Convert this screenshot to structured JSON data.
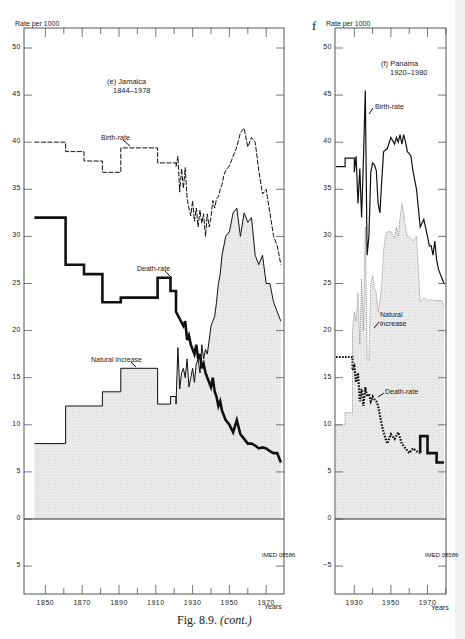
{
  "figure": {
    "caption": "Fig. 8.9. (cont.)",
    "caption_prefix": "Fig. 8.9.",
    "caption_suffix": "(cont.)",
    "panel_f_letter": "f"
  },
  "colors": {
    "fill": "#e3e3e3",
    "line": "#111111",
    "axis": "#555555",
    "text": "#222222"
  },
  "chart_data": [
    {
      "type": "line",
      "title": "(e) Jamaica 1844–1978",
      "title_line1": "(e) Jamaica",
      "title_line2": "1844–1978",
      "ylabel": "Rate per 1000",
      "xlabel": "Years",
      "ylim": [
        -7,
        52
      ],
      "xlim": [
        1840,
        1980
      ],
      "y_ticks": [
        "50",
        "45",
        "40",
        "35",
        "30",
        "25",
        "20",
        "15",
        "10",
        "5",
        "0",
        "5"
      ],
      "x_ticks": [
        "1850",
        "1870",
        "1890",
        "1910",
        "1930",
        "1950",
        "1970"
      ],
      "grid": false,
      "legend": "inline labels",
      "annotations": [
        "Birth-rate",
        "Death-rate",
        "Natural increase"
      ],
      "stamp": "IMED 08586",
      "series": [
        {
          "name": "Birth-rate",
          "style": "dashed",
          "x": [
            1844,
            1861,
            1861,
            1871,
            1871,
            1881,
            1881,
            1891,
            1891,
            1911,
            1911,
            1921,
            1921,
            1922,
            1923,
            1924,
            1925,
            1926,
            1927,
            1928,
            1929,
            1930,
            1931,
            1932,
            1933,
            1934,
            1935,
            1936,
            1937,
            1938,
            1939,
            1940,
            1941,
            1942,
            1943,
            1944,
            1945,
            1946,
            1947,
            1948,
            1950,
            1952,
            1954,
            1956,
            1958,
            1960,
            1962,
            1964,
            1966,
            1968,
            1970,
            1972,
            1974,
            1976,
            1978
          ],
          "values": [
            40.0,
            40.0,
            39.0,
            39.0,
            38.0,
            38.0,
            36.8,
            36.8,
            39.4,
            39.4,
            37.8,
            37.8,
            37.4,
            38.5,
            34.7,
            37.2,
            35.1,
            37.3,
            34.0,
            33.0,
            32.2,
            33.8,
            31.6,
            33.0,
            31.0,
            32.8,
            31.4,
            32.4,
            30.0,
            32.4,
            31.0,
            32.0,
            33.8,
            33.0,
            34.0,
            34.2,
            35.0,
            35.5,
            36.5,
            37.0,
            37.5,
            38.5,
            39.5,
            41.0,
            41.5,
            39.5,
            40.5,
            40.0,
            37.0,
            34.5,
            35.0,
            32.5,
            30.0,
            29.0,
            27.0
          ]
        },
        {
          "name": "Death-rate",
          "style": "thick-solid",
          "x": [
            1844,
            1861,
            1861,
            1871,
            1871,
            1881,
            1881,
            1891,
            1891,
            1911,
            1911,
            1918,
            1918,
            1921,
            1921,
            1925,
            1926,
            1927,
            1928,
            1929,
            1930,
            1931,
            1932,
            1933,
            1934,
            1935,
            1936,
            1937,
            1938,
            1939,
            1940,
            1941,
            1942,
            1943,
            1944,
            1945,
            1946,
            1947,
            1948,
            1950,
            1952,
            1954,
            1956,
            1958,
            1960,
            1962,
            1964,
            1966,
            1968,
            1970,
            1972,
            1974,
            1976,
            1978
          ],
          "values": [
            32.0,
            32.0,
            27.0,
            27.0,
            26.0,
            26.0,
            23.0,
            23.0,
            23.5,
            23.5,
            25.6,
            25.6,
            24.2,
            24.2,
            22.0,
            20.5,
            21.0,
            19.0,
            19.5,
            18.5,
            18.0,
            17.5,
            18.5,
            17.0,
            17.5,
            16.0,
            16.5,
            15.5,
            15.0,
            14.5,
            14.0,
            15.0,
            13.5,
            13.0,
            12.0,
            12.5,
            11.5,
            11.0,
            10.5,
            10.0,
            9.2,
            10.5,
            9.0,
            8.5,
            8.0,
            8.0,
            7.8,
            7.5,
            7.6,
            7.5,
            7.2,
            7.0,
            7.0,
            6.0
          ]
        },
        {
          "name": "Natural increase",
          "style": "solid-filled",
          "x": [
            1844,
            1861,
            1861,
            1881,
            1881,
            1891,
            1891,
            1911,
            1911,
            1918,
            1918,
            1921,
            1921,
            1922,
            1923,
            1924,
            1925,
            1926,
            1927,
            1928,
            1929,
            1930,
            1931,
            1932,
            1933,
            1934,
            1935,
            1936,
            1937,
            1938,
            1939,
            1940,
            1941,
            1942,
            1943,
            1944,
            1945,
            1946,
            1947,
            1948,
            1950,
            1952,
            1954,
            1956,
            1958,
            1960,
            1962,
            1964,
            1966,
            1968,
            1970,
            1972,
            1974,
            1976,
            1978
          ],
          "values": [
            8.0,
            8.0,
            12.0,
            12.0,
            13.5,
            13.5,
            16.0,
            16.0,
            12.2,
            12.2,
            13.0,
            13.0,
            12.2,
            18.2,
            13.8,
            15.5,
            16.0,
            15.0,
            17.0,
            14.0,
            15.0,
            16.0,
            14.5,
            16.5,
            17.0,
            15.5,
            18.5,
            17.0,
            18.0,
            17.5,
            19.0,
            20.5,
            21.0,
            21.5,
            23.0,
            25.0,
            26.0,
            28.0,
            29.0,
            30.0,
            30.5,
            32.5,
            33.0,
            30.0,
            32.5,
            31.5,
            32.0,
            28.0,
            27.0,
            28.0,
            25.0,
            25.0,
            23.0,
            22.0,
            21.0
          ]
        }
      ]
    },
    {
      "type": "line",
      "title": "(f) Panama 1920–1980",
      "title_line1": "(f) Panama",
      "title_line2": "1920–1980",
      "ylabel": "Rate per 1000",
      "xlabel": "Years",
      "ylim": [
        -7,
        52
      ],
      "xlim": [
        1920,
        1980
      ],
      "y_ticks": [
        "50",
        "45",
        "40",
        "35",
        "30",
        "25",
        "20",
        "15",
        "10",
        "5",
        "0",
        "−5"
      ],
      "x_ticks": [
        "1930",
        "1950",
        "1970"
      ],
      "grid": false,
      "legend": "inline labels",
      "annotations": [
        "Birth-rate",
        "Natural increase",
        "Death-rate"
      ],
      "annotation_natural_line1": "Natural",
      "annotation_natural_line2": "increase",
      "stamp": "IMED 08586",
      "series": [
        {
          "name": "Birth-rate",
          "style": "solid",
          "x": [
            1920,
            1925,
            1925,
            1930,
            1930,
            1931,
            1932,
            1933,
            1934,
            1935,
            1936,
            1937,
            1938,
            1939,
            1940,
            1941,
            1942,
            1943,
            1944,
            1945,
            1946,
            1948,
            1950,
            1952,
            1953,
            1954,
            1955,
            1956,
            1957,
            1958,
            1959,
            1960,
            1961,
            1962,
            1964,
            1966,
            1968,
            1970,
            1971,
            1972,
            1973,
            1974,
            1975,
            1976,
            1977,
            1978,
            1979
          ],
          "values": [
            37.4,
            37.4,
            38.3,
            38.3,
            36.8,
            38.5,
            33.5,
            37.2,
            32.0,
            38.0,
            45.5,
            28.0,
            30.0,
            36.8,
            37.8,
            37.6,
            37.0,
            33.5,
            32.5,
            36.0,
            39.0,
            39.3,
            40.5,
            39.8,
            40.5,
            40.0,
            40.8,
            39.8,
            40.8,
            40.0,
            39.0,
            38.8,
            38.5,
            37.0,
            35.0,
            31.0,
            31.8,
            30.0,
            29.0,
            29.0,
            28.0,
            29.5,
            27.5,
            26.5,
            26.0,
            25.5,
            25.0
          ]
        },
        {
          "name": "Death-rate",
          "style": "dotted-then-thick",
          "x": [
            1920,
            1929,
            1929,
            1930,
            1931,
            1932,
            1933,
            1934,
            1935,
            1936,
            1937,
            1938,
            1939,
            1940,
            1941,
            1942,
            1943,
            1944,
            1945,
            1946,
            1948,
            1950,
            1952,
            1954,
            1956,
            1958,
            1960,
            1962,
            1964,
            1966,
            1966,
            1968,
            1968,
            1970,
            1970,
            1975,
            1975,
            1979
          ],
          "values": [
            17.2,
            17.2,
            15.8,
            16.2,
            14.5,
            15.5,
            12.5,
            13.8,
            12.0,
            14.0,
            13.0,
            13.3,
            12.5,
            13.0,
            12.7,
            12.5,
            12.0,
            11.0,
            10.0,
            9.2,
            8.0,
            9.0,
            8.5,
            9.2,
            8.0,
            7.5,
            7.0,
            7.5,
            7.2,
            7.0,
            8.8,
            8.8,
            8.8,
            8.8,
            7.0,
            7.0,
            6.0,
            6.0
          ]
        },
        {
          "name": "Natural increase",
          "style": "dotted-filled",
          "x": [
            1920,
            1925,
            1925,
            1929,
            1929,
            1930,
            1931,
            1932,
            1933,
            1934,
            1935,
            1936,
            1937,
            1938,
            1939,
            1940,
            1941,
            1942,
            1943,
            1944,
            1945,
            1946,
            1947,
            1948,
            1950,
            1952,
            1953,
            1954,
            1955,
            1956,
            1957,
            1958,
            1959,
            1960,
            1962,
            1964,
            1966,
            1968,
            1970,
            1972,
            1974,
            1976,
            1978,
            1979
          ],
          "values": [
            10.0,
            10.0,
            11.3,
            11.3,
            20.0,
            22.0,
            21.0,
            24.0,
            18.5,
            25.5,
            20.0,
            31.0,
            17.0,
            16.8,
            25.0,
            25.8,
            24.5,
            24.0,
            22.0,
            23.0,
            25.0,
            28.5,
            30.0,
            30.5,
            30.5,
            29.8,
            31.0,
            30.0,
            32.0,
            33.5,
            32.5,
            31.0,
            30.0,
            30.0,
            29.5,
            30.0,
            23.0,
            23.5,
            23.2,
            23.3,
            23.2,
            23.2,
            23.2,
            22.5
          ]
        }
      ]
    }
  ]
}
